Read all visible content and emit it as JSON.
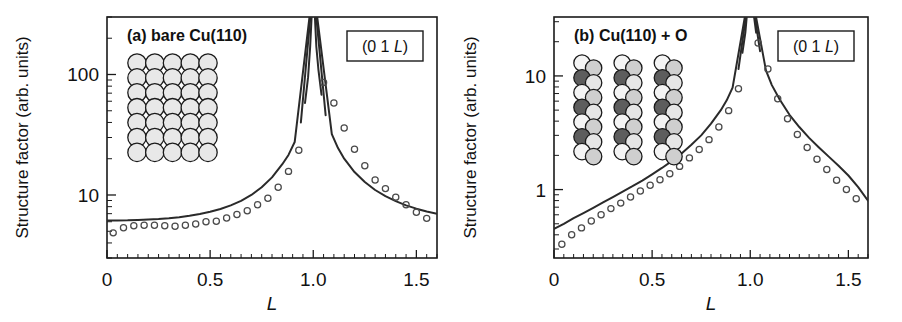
{
  "figure": {
    "background": "#ffffff",
    "width": 902,
    "height": 322
  },
  "chart_data": [
    {
      "type": "line",
      "panel_id": "a",
      "title": "(a) bare Cu(110)",
      "annotation": "(0 1 L)",
      "annotation_prefix": "(0 1 ",
      "annotation_italic": "L",
      "annotation_suffix": ")",
      "xlabel": "L",
      "ylabel": "Structure factor (arb. units)",
      "xlim": [
        0.0,
        1.6
      ],
      "ylim": [
        3.0,
        300.0
      ],
      "yscale": "log",
      "xscale": "linear",
      "grid": false,
      "legend": "none",
      "xticks": [
        0.0,
        0.5,
        1.0,
        1.5
      ],
      "xticklabels": [
        "0",
        "0.5",
        "1.0",
        "1.5"
      ],
      "xminor_step": 0.05,
      "yticks": [
        10,
        100
      ],
      "yticklabels": [
        "10",
        "100"
      ],
      "series": [
        {
          "name": "measured structure factor",
          "marker": "open-circle",
          "x": [
            0.03,
            0.08,
            0.13,
            0.18,
            0.23,
            0.28,
            0.33,
            0.38,
            0.43,
            0.48,
            0.53,
            0.58,
            0.63,
            0.68,
            0.73,
            0.78,
            0.83,
            0.88,
            0.93,
            1.05,
            1.1,
            1.15,
            1.2,
            1.25,
            1.3,
            1.35,
            1.4,
            1.45,
            1.5,
            1.55
          ],
          "y": [
            4.85,
            5.35,
            5.55,
            5.6,
            5.6,
            5.55,
            5.5,
            5.6,
            5.75,
            6.0,
            6.05,
            6.45,
            6.9,
            7.4,
            8.3,
            9.4,
            11.6,
            15.7,
            23.5,
            86.0,
            58.0,
            36.0,
            24.0,
            17.5,
            13.3,
            11.3,
            9.6,
            8.3,
            7.2,
            6.4
          ]
        },
        {
          "name": "model fit",
          "marker": "none",
          "x": [
            0.0,
            0.05,
            0.1,
            0.15,
            0.2,
            0.25,
            0.3,
            0.35,
            0.4,
            0.45,
            0.5,
            0.55,
            0.6,
            0.65,
            0.7,
            0.75,
            0.8,
            0.85,
            0.88,
            0.91,
            0.94,
            0.96,
            0.975,
            0.985,
            1.015,
            1.025,
            1.04,
            1.06,
            1.09,
            1.12,
            1.15,
            1.2,
            1.25,
            1.3,
            1.35,
            1.4,
            1.45,
            1.5,
            1.55,
            1.6
          ],
          "y": [
            6.15,
            6.15,
            6.16,
            6.2,
            6.25,
            6.32,
            6.42,
            6.55,
            6.72,
            6.95,
            7.25,
            7.65,
            8.2,
            8.95,
            10.0,
            11.6,
            14.0,
            18.0,
            21.5,
            27.5,
            40.0,
            58.0,
            95.0,
            170.0,
            170.0,
            110.0,
            68.0,
            46.0,
            32.0,
            24.5,
            20.0,
            15.5,
            12.8,
            11.0,
            9.8,
            8.9,
            8.2,
            7.7,
            7.3,
            7.0
          ]
        }
      ],
      "inset": {
        "name": "cu110-clean-surface-model",
        "kind": "sphere-lattice",
        "rows": 7,
        "cols": 5,
        "atom_color": "#e8e8e8",
        "atom_edge": "#1a1a1a"
      }
    },
    {
      "type": "line",
      "panel_id": "b",
      "title": "(b) Cu(110) + O",
      "annotation": "(0 1 L)",
      "annotation_prefix": "(0 1 ",
      "annotation_italic": "L",
      "annotation_suffix": ")",
      "xlabel": "L",
      "ylabel": "Structure factor (arb. units)",
      "xlim": [
        0.0,
        1.6
      ],
      "ylim": [
        0.25,
        33.0
      ],
      "yscale": "log",
      "xscale": "linear",
      "grid": false,
      "legend": "none",
      "xticks": [
        0.0,
        0.5,
        1.0,
        1.5
      ],
      "xticklabels": [
        "0",
        "0.5",
        "1.0",
        "1.5"
      ],
      "xminor_step": 0.05,
      "yticks": [
        1,
        10
      ],
      "yticklabels": [
        "1",
        "10"
      ],
      "series": [
        {
          "name": "measured structure factor",
          "marker": "open-circle",
          "x": [
            0.04,
            0.09,
            0.14,
            0.19,
            0.24,
            0.29,
            0.34,
            0.39,
            0.44,
            0.49,
            0.54,
            0.59,
            0.64,
            0.69,
            0.74,
            0.79,
            0.84,
            0.89,
            0.94,
            1.04,
            1.09,
            1.14,
            1.19,
            1.24,
            1.29,
            1.34,
            1.39,
            1.44,
            1.49,
            1.54
          ],
          "y": [
            0.33,
            0.4,
            0.46,
            0.53,
            0.6,
            0.68,
            0.76,
            0.86,
            0.97,
            1.09,
            1.22,
            1.38,
            1.6,
            1.9,
            2.25,
            2.75,
            3.55,
            4.95,
            7.7,
            19.5,
            11.5,
            6.3,
            4.2,
            3.05,
            2.35,
            1.85,
            1.5,
            1.21,
            1.0,
            0.83
          ]
        },
        {
          "name": "model fit",
          "marker": "none",
          "x": [
            0.0,
            0.05,
            0.1,
            0.15,
            0.2,
            0.25,
            0.3,
            0.35,
            0.4,
            0.45,
            0.5,
            0.55,
            0.6,
            0.65,
            0.7,
            0.75,
            0.8,
            0.85,
            0.88,
            0.91,
            0.94,
            0.96,
            0.975,
            0.985,
            1.015,
            1.03,
            1.05,
            1.08,
            1.11,
            1.15,
            1.2,
            1.25,
            1.3,
            1.35,
            1.4,
            1.45,
            1.5,
            1.55,
            1.6
          ],
          "y": [
            0.45,
            0.5,
            0.56,
            0.62,
            0.69,
            0.77,
            0.86,
            0.96,
            1.07,
            1.2,
            1.36,
            1.55,
            1.78,
            2.08,
            2.48,
            3.0,
            3.8,
            5.0,
            6.1,
            7.9,
            11.5,
            16.0,
            24.0,
            38.0,
            38.0,
            24.0,
            16.5,
            11.2,
            8.3,
            6.2,
            4.55,
            3.55,
            2.85,
            2.35,
            1.95,
            1.62,
            1.33,
            1.05,
            0.8
          ]
        }
      ],
      "inset": {
        "name": "cu110-added-row-oxygen-model",
        "kind": "sphere-chains",
        "chains": 3,
        "rows": 7,
        "cu_color": "#e3e3e3",
        "cu_mid_color": "#cfcfcf",
        "o_color": "#5d5d5d",
        "atom_edge": "#1a1a1a"
      }
    }
  ]
}
